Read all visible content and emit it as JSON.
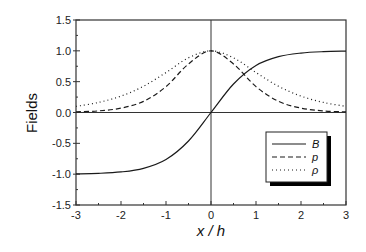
{
  "chart_data": {
    "type": "line",
    "title": "",
    "xlabel": "x / h",
    "ylabel": "Fields",
    "xlim": [
      -3,
      3
    ],
    "ylim": [
      -1.5,
      1.5
    ],
    "xticks": [
      -3,
      -2,
      -1,
      0,
      1,
      2,
      3
    ],
    "xtick_labels": [
      "-3",
      "-2",
      "-1",
      "0",
      "1",
      "2",
      "3"
    ],
    "yticks": [
      -1.5,
      -1.0,
      -0.5,
      0.0,
      0.5,
      1.0,
      1.5
    ],
    "ytick_labels": [
      "-1.5",
      "-1.0",
      "-0.5",
      "0.0",
      "0.5",
      "1.0",
      "1.5"
    ],
    "grid": false,
    "reference_lines": {
      "x0": true,
      "y0": true
    },
    "legend_position": "lower right",
    "x": [
      -3,
      -2.5,
      -2,
      -1.5,
      -1,
      -0.5,
      0,
      0.5,
      1,
      1.5,
      2,
      2.5,
      3
    ],
    "series": [
      {
        "name": "B",
        "style": "solid",
        "values": [
          -0.995,
          -0.987,
          -0.964,
          -0.905,
          -0.762,
          -0.462,
          0.0,
          0.462,
          0.762,
          0.905,
          0.964,
          0.987,
          0.995
        ]
      },
      {
        "name": "p",
        "style": "dashed",
        "values": [
          0.01,
          0.026,
          0.071,
          0.181,
          0.42,
          0.787,
          1.0,
          0.787,
          0.42,
          0.181,
          0.071,
          0.026,
          0.01
        ]
      },
      {
        "name": "ρ",
        "style": "dotted",
        "values": [
          0.099,
          0.163,
          0.266,
          0.425,
          0.648,
          0.887,
          1.0,
          0.887,
          0.648,
          0.425,
          0.266,
          0.163,
          0.099
        ]
      }
    ]
  },
  "axes": {
    "xlabel": "x / h",
    "ylabel": "Fields"
  },
  "legend": {
    "items": [
      {
        "label": "B",
        "style": "solid"
      },
      {
        "label": "p",
        "style": "dashed"
      },
      {
        "label": "ρ",
        "style": "dotted"
      }
    ]
  },
  "colors": {
    "line": "#1a1a1a",
    "frame": "#333333",
    "background": "#ffffff"
  }
}
